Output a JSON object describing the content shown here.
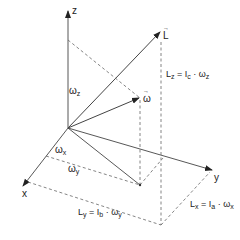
{
  "diagram": {
    "axes": {
      "z": {
        "label": "z"
      },
      "x": {
        "label": "x"
      },
      "y": {
        "label": "y"
      }
    },
    "vectors": {
      "L": {
        "label": "L"
      },
      "omega": {
        "label": "ω"
      }
    },
    "components": {
      "omega_z": {
        "symbol": "ω",
        "sub": "z"
      },
      "omega_x": {
        "symbol": "ω",
        "sub": "x"
      },
      "omega_y": {
        "symbol": "ω",
        "sub": "y"
      }
    },
    "equations": {
      "Lz": {
        "lhs": "L",
        "lhs_sub": "z",
        "eq": " = I",
        "i_sub": "c",
        "rhs": " · ω",
        "rhs_sub": "z"
      },
      "Ly": {
        "lhs": "L",
        "lhs_sub": "y",
        "eq": " = I",
        "i_sub": "b",
        "rhs": " · ω",
        "rhs_sub": "y"
      },
      "Lx": {
        "lhs": "L",
        "lhs_sub": "x",
        "eq": " = I",
        "i_sub": "a",
        "rhs": " · ω",
        "rhs_sub": "x"
      }
    },
    "colors": {
      "line": "#333333",
      "dashed": "#555555"
    }
  }
}
